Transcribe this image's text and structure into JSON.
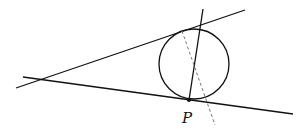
{
  "diagram": {
    "labels": {
      "point_p": "P"
    },
    "colors": {
      "stroke": "#111111",
      "dashed": "#777777",
      "background": "#ffffff"
    },
    "circle": {
      "cx": 194,
      "cy": 64,
      "r": 35
    },
    "point_p": {
      "x": 189,
      "y": 100
    },
    "lines": {
      "upper_tangent": {
        "x1": 16,
        "y1": 88,
        "x2": 245,
        "y2": 10
      },
      "lower_tangent": {
        "x1": 23,
        "y1": 77,
        "x2": 293,
        "y2": 114
      },
      "chord": {
        "x1": 203,
        "y1": 9,
        "x2": 189,
        "y2": 100
      },
      "dashed": {
        "x1": 182,
        "y1": 31,
        "x2": 215,
        "y2": 125
      }
    }
  }
}
